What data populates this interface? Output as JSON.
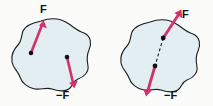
{
  "figure": {
    "background_color": "#fbfbfa",
    "body_fill_color": "#e2eef2",
    "body_outline_color": "#1c1c1c",
    "arrow_color": "#d6306b",
    "dot_color": "#111111",
    "line_of_action_color": "#1c1c1c",
    "panels": [
      {
        "id": "left",
        "name": "separate-lines-of-action",
        "labels": [
          {
            "id": "f-left",
            "text": "F",
            "x": 40,
            "y": 4
          },
          {
            "id": "negf-left",
            "text": "−F",
            "x": 56,
            "y": 90
          }
        ],
        "points": [
          {
            "id": "application-point-upper",
            "x": 31,
            "y": 53
          },
          {
            "id": "application-point-lower",
            "x": 67,
            "y": 57
          }
        ],
        "arrows": [
          {
            "id": "force-f",
            "from": [
              31,
              53
            ],
            "to": [
              43,
              21
            ],
            "label": "F"
          },
          {
            "id": "force-neg-f",
            "from": [
              67,
              57
            ],
            "to": [
              74,
              87
            ],
            "label": "−F"
          }
        ]
      },
      {
        "id": "right",
        "name": "common-line-of-action",
        "labels": [
          {
            "id": "f-right",
            "text": "F",
            "x": 182,
            "y": 9
          },
          {
            "id": "negf-right",
            "text": "−F",
            "x": 164,
            "y": 90
          }
        ],
        "points": [
          {
            "id": "application-point-upper",
            "x": 163,
            "y": 38
          },
          {
            "id": "application-point-lower",
            "x": 155,
            "y": 66
          }
        ],
        "arrows": [
          {
            "id": "force-f",
            "from": [
              163,
              38
            ],
            "to": [
              180,
              10
            ],
            "label": "F"
          },
          {
            "id": "force-neg-f",
            "from": [
              155,
              66
            ],
            "to": [
              146,
              96
            ],
            "label": "−F"
          }
        ],
        "dashed_line": {
          "from": [
            163,
            38
          ],
          "to": [
            155,
            66
          ]
        }
      }
    ]
  }
}
